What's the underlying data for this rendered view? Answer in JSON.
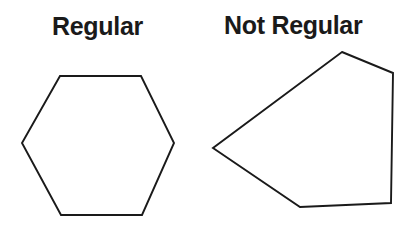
{
  "page": {
    "background_color": "#ffffff",
    "width": 416,
    "height": 233
  },
  "figures": [
    {
      "id": "regular-hexagon",
      "label": "Regular",
      "shape_name": "hexagon",
      "sides": 6,
      "is_regular": true,
      "stroke_color": "#1a1a1a",
      "fill_color": "#ffffff",
      "points": "60,76 141,76 174,143 142,215 61,215 22,143"
    },
    {
      "id": "irregular-pentagon",
      "label": "Not Regular",
      "shape_name": "pentagon",
      "sides": 5,
      "is_regular": false,
      "stroke_color": "#1a1a1a",
      "fill_color": "#ffffff",
      "points": "342,52 393,73 391,203 300,207 213,148"
    }
  ]
}
